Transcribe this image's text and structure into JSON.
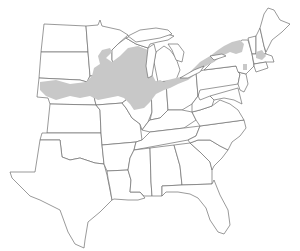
{
  "map": {
    "title": "Range map",
    "region": "Eastern and Central United States",
    "range_fill_color": "#c8c8c8",
    "border_color": "#6e6e6e",
    "background_color": "#ffffff",
    "shaded_range_description": "Northern Great Plains through Upper Midwest and Great Lakes region to northern New England"
  }
}
